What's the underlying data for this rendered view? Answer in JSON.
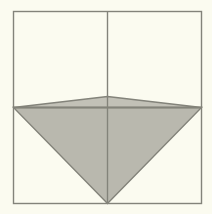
{
  "figure": {
    "canvas": {
      "width": 212,
      "height": 214
    },
    "colors": {
      "background": "#fbfbf0",
      "paper": "#fbfbf0",
      "stroke": "#83837a",
      "fill": "#b9b8ae",
      "fill_light": "#c2c1b7"
    },
    "square": {
      "name": "outer-square",
      "left": 13.5,
      "top": 11.5,
      "right": 201.5,
      "bottom": 203.5,
      "stroke_width": 1.4
    },
    "guides": [
      {
        "name": "vertical-center-line",
        "x1": 107.5,
        "y1": 11.5,
        "x2": 107.5,
        "y2": 203.5
      },
      {
        "name": "horizontal-mid-line",
        "x1": 13.5,
        "y1": 107.5,
        "x2": 201.5,
        "y2": 107.5
      }
    ],
    "shapes": [
      {
        "name": "inverted-triangle",
        "points": "13.5,107.5 201.5,107.5 107.5,203.5",
        "filled": true,
        "stroke_width": 1.4
      },
      {
        "name": "upper-shallow-triangle",
        "points": "13.5,107.5 107.5,96.5 201.5,107.5",
        "filled": true,
        "stroke_width": 1.4
      }
    ],
    "vertices": [
      {
        "name": "left-mid-vertex",
        "x": 13.5,
        "y": 107.5
      },
      {
        "name": "right-mid-vertex",
        "x": 201.5,
        "y": 107.5
      },
      {
        "name": "bottom-apex-vertex",
        "x": 107.5,
        "y": 203.5
      },
      {
        "name": "upper-peak-vertex",
        "x": 107.5,
        "y": 96.5
      }
    ]
  }
}
